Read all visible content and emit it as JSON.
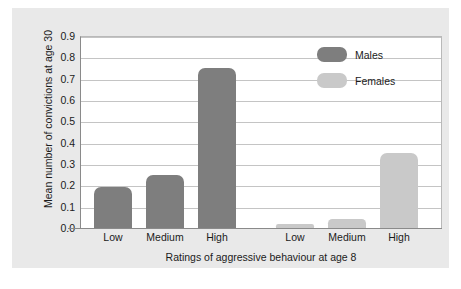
{
  "chart_data": {
    "type": "bar",
    "title": "",
    "xlabel": "Ratings of aggressive behaviour at age 8",
    "ylabel": "Mean number of convictions at age 30",
    "categories": [
      "Low",
      "Medium",
      "High"
    ],
    "tick_labels": [
      "Low",
      "Medium",
      "High",
      "Low",
      "Medium",
      "High"
    ],
    "series": [
      {
        "name": "Males",
        "color": "#7e7e7e",
        "values": [
          0.19,
          0.25,
          0.75
        ]
      },
      {
        "name": "Females",
        "color": "#c9c9c9",
        "values": [
          0.02,
          0.04,
          0.35
        ]
      }
    ],
    "bars": [
      {
        "label": "Low",
        "group": "Males",
        "value": 0.19
      },
      {
        "label": "Medium",
        "group": "Males",
        "value": 0.25
      },
      {
        "label": "High",
        "group": "Males",
        "value": 0.75
      },
      {
        "label": "Low",
        "group": "Females",
        "value": 0.02
      },
      {
        "label": "Medium",
        "group": "Females",
        "value": 0.04
      },
      {
        "label": "High",
        "group": "Females",
        "value": 0.35
      }
    ],
    "ylim": [
      0.0,
      0.9
    ],
    "ytick_values": [
      "0.0",
      "0.1",
      "0.2",
      "0.3",
      "0.4",
      "0.5",
      "0.6",
      "0.7",
      "0.8",
      "0.9"
    ],
    "grid": true,
    "legend_position": "top-right",
    "legend": [
      {
        "label": "Males",
        "color": "#7e7e7e"
      },
      {
        "label": "Females",
        "color": "#c9c9c9"
      }
    ],
    "colors": {
      "males": "#7e7e7e",
      "females": "#c9c9c9",
      "panel_background": "#e9e9e9",
      "plot_background": "#ffffff",
      "gridline": "#c4c4c4",
      "axis": "#8a8a8a",
      "text": "#1b1b1b"
    }
  }
}
